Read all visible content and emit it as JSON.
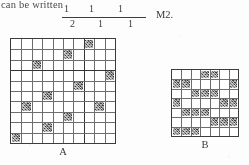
{
  "page": {
    "width": 249,
    "height": 165,
    "background_color": "#fdfdfd",
    "ink_color": "#2e2e2e"
  },
  "running_text": "can be written",
  "expression": {
    "kind": "stacked-fraction",
    "numerators": [
      "1",
      "1",
      "1"
    ],
    "denominators": [
      "2",
      "1",
      "1"
    ],
    "has_vinculum": true
  },
  "problem_label": "M2.",
  "figures": [
    {
      "id": "A",
      "caption": "A",
      "rows": 10,
      "cols": 10,
      "major_row_divider_after": 3,
      "major_col_divider_after": 7,
      "filled_cells": [
        [
          0,
          7
        ],
        [
          1,
          5
        ],
        [
          2,
          2
        ],
        [
          3,
          9
        ],
        [
          4,
          6
        ],
        [
          5,
          3
        ],
        [
          6,
          1
        ],
        [
          6,
          8
        ],
        [
          7,
          5
        ],
        [
          8,
          3
        ],
        [
          9,
          0
        ]
      ]
    },
    {
      "id": "B",
      "caption": "B",
      "rows": 7,
      "cols": 7,
      "filled_cells": [
        [
          0,
          3
        ],
        [
          0,
          4
        ],
        [
          1,
          0
        ],
        [
          1,
          1
        ],
        [
          1,
          6
        ],
        [
          2,
          2
        ],
        [
          2,
          3
        ],
        [
          2,
          4
        ],
        [
          3,
          0
        ],
        [
          3,
          5
        ],
        [
          3,
          6
        ],
        [
          4,
          1
        ],
        [
          4,
          2
        ],
        [
          4,
          3
        ],
        [
          5,
          4
        ],
        [
          5,
          5
        ],
        [
          5,
          6
        ],
        [
          6,
          0
        ],
        [
          6,
          1
        ],
        [
          6,
          2
        ]
      ]
    }
  ]
}
